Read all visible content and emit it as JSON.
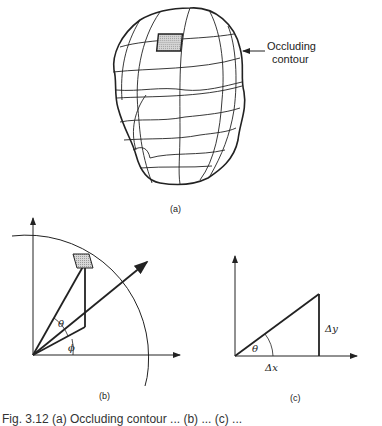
{
  "figure": {
    "panel_a": {
      "label": "(a)",
      "annotation_line1": "Occluding",
      "annotation_line2": "contour",
      "description": "Head-shaped surface with latitude/longitude grid and a shaded surface patch"
    },
    "panel_b": {
      "label": "(b)",
      "angle_theta": "θ",
      "angle_phi": "ϕ",
      "description": "Coordinate axes with arc, viewing vector, and shaded patch; angles theta and phi"
    },
    "panel_c": {
      "label": "(c)",
      "angle_theta": "θ",
      "delta_x": "Δx",
      "delta_y": "Δy",
      "description": "Right triangle with angle theta, horizontal Δx and vertical Δy"
    },
    "caption": "Fig. 3.12  (a) Occluding contour ...  (b) ...  (c) ..."
  },
  "colors": {
    "ink": "#222222",
    "patch_fill": "#bdbdbd",
    "background": "#ffffff"
  }
}
